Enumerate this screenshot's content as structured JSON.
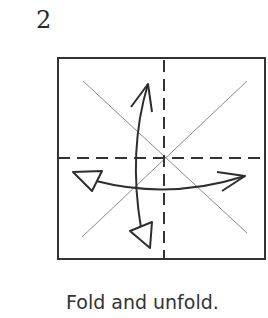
{
  "step": {
    "number": "2"
  },
  "caption": {
    "text": "Fold and unfold."
  },
  "diagram": {
    "paper_square": {
      "x": 58,
      "y": 58,
      "width": 207,
      "height": 201,
      "stroke": "#333333"
    },
    "colors": {
      "line": "#333333",
      "crease": "#8a8a8a",
      "arrow": "#2e2e2e"
    },
    "valley_folds": [
      {
        "name": "vertical-valley-fold",
        "x1": 164,
        "y1": 58,
        "x2": 164,
        "y2": 259
      },
      {
        "name": "horizontal-valley-fold",
        "x1": 58,
        "y1": 158,
        "x2": 265,
        "y2": 158
      }
    ],
    "diagonal_creases": [
      {
        "name": "diagonal-crease-a",
        "x1": 83,
        "y1": 81,
        "x2": 247,
        "y2": 233
      },
      {
        "name": "diagonal-crease-b",
        "x1": 247,
        "y1": 81,
        "x2": 82,
        "y2": 237
      }
    ],
    "arrows": [
      {
        "name": "fold-arrow-vertical",
        "description": "Curved arrow: fold down and unfold (push) up"
      },
      {
        "name": "fold-arrow-horizontal",
        "description": "Curved arrow: fold right and unfold (push) left"
      }
    ]
  }
}
